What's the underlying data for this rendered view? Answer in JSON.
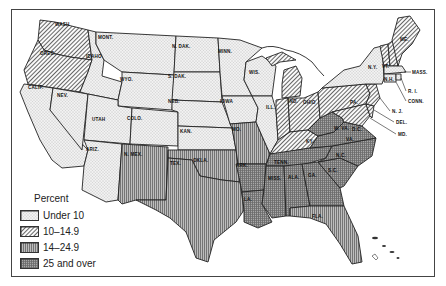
{
  "legend": {
    "title": "Percent",
    "items": [
      {
        "label": "Under 10",
        "pattern": "dots"
      },
      {
        "label": "10–14.9",
        "pattern": "diagonal"
      },
      {
        "label": "14–24.9",
        "pattern": "vertical"
      },
      {
        "label": "25 and over",
        "pattern": "grid"
      }
    ]
  },
  "states": [
    {
      "abbr": "WASH",
      "category": "10–14.9"
    },
    {
      "abbr": "ORE.",
      "category": "10–14.9"
    },
    {
      "abbr": "CALIF.",
      "category": "Under 10"
    },
    {
      "abbr": "IDAHO",
      "category": "Under 10"
    },
    {
      "abbr": "NEV.",
      "category": "Under 10"
    },
    {
      "abbr": "MONT.",
      "category": "Under 10"
    },
    {
      "abbr": "WYO.",
      "category": "Under 10"
    },
    {
      "abbr": "UTAH",
      "category": "Under 10"
    },
    {
      "abbr": "COLO.",
      "category": "Under 10"
    },
    {
      "abbr": "ARIZ.",
      "category": "Under 10"
    },
    {
      "abbr": "N. MEX.",
      "category": "14–24.9"
    },
    {
      "abbr": "N. DAK.",
      "category": "Under 10"
    },
    {
      "abbr": "S. DAK.",
      "category": "Under 10"
    },
    {
      "abbr": "NEB.",
      "category": "Under 10"
    },
    {
      "abbr": "KAN.",
      "category": "Under 10"
    },
    {
      "abbr": "OKLA.",
      "category": "14–24.9"
    },
    {
      "abbr": "TEX.",
      "category": "14–24.9"
    },
    {
      "abbr": "MINN.",
      "category": "Under 10"
    },
    {
      "abbr": "IOWA",
      "category": "Under 10"
    },
    {
      "abbr": "MO.",
      "category": "14–24.9"
    },
    {
      "abbr": "ARK.",
      "category": "25 and over"
    },
    {
      "abbr": "LA.",
      "category": "25 and over"
    },
    {
      "abbr": "WIS.",
      "category": "Under 10"
    },
    {
      "abbr": "ILL.",
      "category": "Under 10"
    },
    {
      "abbr": "MICH.",
      "category": "10–14.9"
    },
    {
      "abbr": "IND.",
      "category": "10–14.9"
    },
    {
      "abbr": "OHIO",
      "category": "10–14.9"
    },
    {
      "abbr": "KY.",
      "category": "10–14.9"
    },
    {
      "abbr": "TENN.",
      "category": "25 and over"
    },
    {
      "abbr": "MISS.",
      "category": "25 and over"
    },
    {
      "abbr": "ALA.",
      "category": "25 and over"
    },
    {
      "abbr": "GA.",
      "category": "25 and over"
    },
    {
      "abbr": "FLA.",
      "category": "14–24.9"
    },
    {
      "abbr": "S.C.",
      "category": "25 and over"
    },
    {
      "abbr": "N.C.",
      "category": "25 and over"
    },
    {
      "abbr": "VA.",
      "category": "25 and over"
    },
    {
      "abbr": "W. VA.",
      "category": "25 and over"
    },
    {
      "abbr": "D.C.",
      "category": "25 and over"
    },
    {
      "abbr": "MD.",
      "category": "10–14.9"
    },
    {
      "abbr": "DEL.",
      "category": "10–14.9"
    },
    {
      "abbr": "PA.",
      "category": "10–14.9"
    },
    {
      "abbr": "N.J.",
      "category": "10–14.9"
    },
    {
      "abbr": "N.Y.",
      "category": "Under 10"
    },
    {
      "abbr": "CONN.",
      "category": "Under 10"
    },
    {
      "abbr": "R.I.",
      "category": "Under 10"
    },
    {
      "abbr": "MASS.",
      "category": "Under 10"
    },
    {
      "abbr": "VT.",
      "category": "10–14.9"
    },
    {
      "abbr": "N.H.",
      "category": "10–14.9"
    },
    {
      "abbr": "ME.",
      "category": "10–14.9"
    }
  ]
}
